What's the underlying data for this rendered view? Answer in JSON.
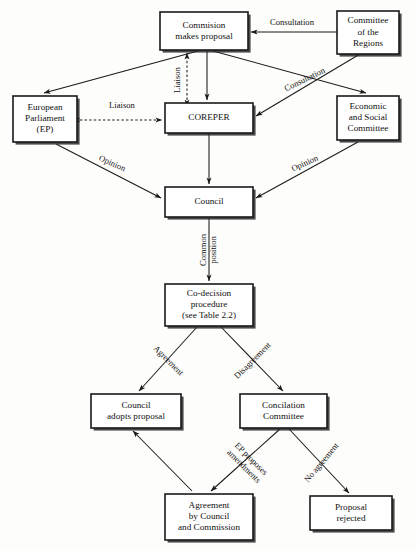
{
  "diagram": {
    "colors": {
      "background": "#fdfdfb",
      "box_fill": "#ffffff",
      "stroke": "#1a1a1a",
      "text": "#111111",
      "shadow": "#2b2b2b"
    },
    "nodes": [
      {
        "id": "commission",
        "name": "commission-makes-proposal",
        "lines": [
          "Commision",
          "makes proposal"
        ],
        "x": 160,
        "y": 12,
        "w": 88,
        "h": 38
      },
      {
        "id": "committee-regions",
        "name": "committee-of-the-regions",
        "lines": [
          "Committee",
          "of the",
          "Regions"
        ],
        "x": 337,
        "y": 11,
        "w": 62,
        "h": 43
      },
      {
        "id": "european-parliament",
        "name": "european-parliament",
        "lines": [
          "European",
          "Parliament",
          "(EP)"
        ],
        "x": 13,
        "y": 96,
        "w": 64,
        "h": 46
      },
      {
        "id": "coreper",
        "name": "coreper",
        "lines": [
          "COREPER"
        ],
        "x": 165,
        "y": 103,
        "w": 88,
        "h": 30
      },
      {
        "id": "economic-social",
        "name": "economic-and-social-committee",
        "lines": [
          "Economic",
          "and Social",
          "Committee"
        ],
        "x": 337,
        "y": 96,
        "w": 62,
        "h": 44
      },
      {
        "id": "council",
        "name": "council",
        "lines": [
          "Council"
        ],
        "x": 165,
        "y": 187,
        "w": 88,
        "h": 30
      },
      {
        "id": "co-decision",
        "name": "co-decision-procedure",
        "lines": [
          "Co-decision",
          "procedure",
          "(see Table 2.2)"
        ],
        "x": 165,
        "y": 284,
        "w": 88,
        "h": 42
      },
      {
        "id": "council-adopts",
        "name": "council-adopts-proposal",
        "lines": [
          "Council",
          "adopts proposal"
        ],
        "x": 91,
        "y": 394,
        "w": 90,
        "h": 34
      },
      {
        "id": "concilation",
        "name": "concilation-committee",
        "lines": [
          "Concilation",
          "Committee"
        ],
        "x": 240,
        "y": 394,
        "w": 87,
        "h": 34
      },
      {
        "id": "agreement",
        "name": "agreement-by-council-and-commission",
        "lines": [
          "Agreement",
          "by Council",
          "and Commission"
        ],
        "x": 165,
        "y": 494,
        "w": 88,
        "h": 46
      },
      {
        "id": "proposal-rejected",
        "name": "proposal-rejected",
        "lines": [
          "Proposal",
          "rejected"
        ],
        "x": 310,
        "y": 496,
        "w": 82,
        "h": 34
      }
    ],
    "edges": [
      {
        "id": "regions-to-commission",
        "name": "edge-consultation-regions-to-commission",
        "label": "Consultation",
        "label_x": 292,
        "label_y": 23,
        "label_rot": 0,
        "style": "solid",
        "path": "M 337 32 L 251 32",
        "arrows": [
          "end"
        ]
      },
      {
        "id": "regions-to-coreper",
        "name": "edge-consultation-regions-to-coreper",
        "label": "Consultation",
        "label_x": 305,
        "label_y": 80,
        "label_rot": -26,
        "style": "solid",
        "path": "M 360 54 L 256 116",
        "arrows": [
          "end"
        ]
      },
      {
        "id": "commission-to-ep",
        "name": "edge-commission-to-european-parliament",
        "label": "",
        "label_x": 0,
        "label_y": 0,
        "label_rot": 0,
        "style": "solid",
        "path": "M 198 51 L 44 93",
        "arrows": [
          "end"
        ]
      },
      {
        "id": "commission-to-economic",
        "name": "edge-commission-to-economic-social-committee",
        "label": "",
        "label_x": 0,
        "label_y": 0,
        "label_rot": 0,
        "style": "solid",
        "path": "M 213 51 L 366 93",
        "arrows": [
          "end"
        ]
      },
      {
        "id": "coreper-to-commission",
        "name": "edge-liaison-coreper-to-commission",
        "label": "Liaison",
        "label_x": 178,
        "label_y": 80,
        "label_rot": -90,
        "style": "dashed",
        "path": "M 187 100 L 187 53",
        "arrows": [
          "start",
          "end"
        ]
      },
      {
        "id": "commission-to-coreper",
        "name": "edge-commission-to-coreper",
        "label": "",
        "label_x": 0,
        "label_y": 0,
        "label_rot": 0,
        "style": "solid",
        "path": "M 207 51 L 207 100",
        "arrows": [
          "end"
        ]
      },
      {
        "id": "ep-coreper-liaison",
        "name": "edge-liaison-ep-to-coreper",
        "label": "Liaison",
        "label_x": 122,
        "label_y": 106,
        "label_rot": 0,
        "style": "dashed",
        "path": "M 80 120 L 162 120",
        "arrows": [
          "start",
          "end"
        ]
      },
      {
        "id": "ep-to-council",
        "name": "edge-opinion-ep-to-council",
        "label": "Opinion",
        "label_x": 112,
        "label_y": 164,
        "label_rot": 24,
        "style": "solid",
        "path": "M 56 144 L 161 198",
        "arrows": [
          "end"
        ]
      },
      {
        "id": "economic-to-council",
        "name": "edge-opinion-economic-to-council",
        "label": "Opinion",
        "label_x": 305,
        "label_y": 164,
        "label_rot": -24,
        "style": "solid",
        "path": "M 358 142 L 256 198",
        "arrows": [
          "end"
        ]
      },
      {
        "id": "coreper-to-council",
        "name": "edge-coreper-to-council",
        "label": "",
        "label_x": 0,
        "label_y": 0,
        "label_rot": 0,
        "style": "solid",
        "path": "M 209 134 L 209 184",
        "arrows": [
          "end"
        ]
      },
      {
        "id": "council-to-codecision",
        "name": "edge-common-position-council-to-codecision",
        "label_line1": "Common",
        "label_line2": "position",
        "label_x": 209,
        "label_y": 250,
        "label_rot": -90,
        "style": "solid",
        "path": "M 209 218 L 209 281",
        "arrows": [
          "end"
        ]
      },
      {
        "id": "codecision-to-adopts",
        "name": "edge-agreement-codecision-to-council-adopts",
        "label": "Agreement",
        "label_x": 168,
        "label_y": 361,
        "label_rot": 45,
        "style": "solid",
        "path": "M 197 327 L 139 391",
        "arrows": [
          "end"
        ]
      },
      {
        "id": "codecision-to-concilation",
        "name": "edge-disagreement-codecision-to-concilation",
        "label": "Disagreement",
        "label_x": 253,
        "label_y": 361,
        "label_rot": -45,
        "style": "solid",
        "path": "M 221 327 L 283 391",
        "arrows": [
          "end"
        ]
      },
      {
        "id": "agreement-to-adopts",
        "name": "edge-agreement-to-council-adopts",
        "label": "",
        "label_x": 0,
        "label_y": 0,
        "label_rot": 0,
        "style": "solid",
        "path": "M 192 491 L 133 431",
        "arrows": [
          "end"
        ]
      },
      {
        "id": "concilation-to-agreement",
        "name": "edge-ep-proposes-amendments",
        "label_line1": "EP proposes",
        "label_line2": "amendments",
        "label_x": 247,
        "label_y": 463,
        "label_rot": 45,
        "style": "solid",
        "path": "M 280 429 L 211 491",
        "arrows": [
          "end"
        ]
      },
      {
        "id": "concilation-to-rejected",
        "name": "edge-no-agreement-to-proposal-rejected",
        "label": "No agreement",
        "label_x": 322,
        "label_y": 463,
        "label_rot": -50,
        "style": "solid",
        "path": "M 289 429 L 349 493",
        "arrows": [
          "end"
        ]
      }
    ]
  }
}
